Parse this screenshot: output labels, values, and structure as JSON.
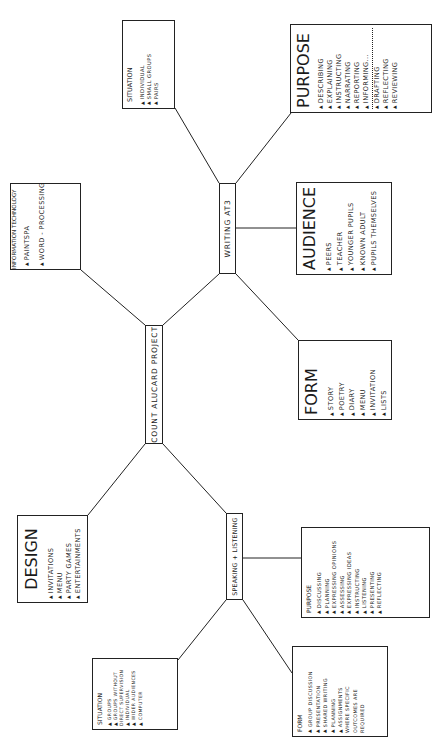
{
  "diagram": {
    "center": {
      "label": "COUNT ALUCARD PROJECT"
    },
    "hubs": {
      "writing": {
        "label": "WRITING AT3"
      },
      "speaking": {
        "label": "SPEAKING + LISTENING"
      }
    },
    "nodes": {
      "it": {
        "title": "INFORMATION TECHNOLOGY",
        "items": [
          "PAINTSPA",
          "WORD - PROCESSING"
        ]
      },
      "design": {
        "title": "DESIGN",
        "items": [
          "INVITATIONS",
          "MENU",
          "PARTY GAMES",
          "ENTERTAINMENTS"
        ]
      },
      "writing_situation": {
        "title": "SITUATION",
        "items": [
          "INDIVIDUAL",
          "SMALL GROUPS",
          "PAIRS"
        ]
      },
      "writing_purpose": {
        "title": "PURPOSE",
        "items": [
          "DESCRIBING",
          "EXPLAINING",
          "INSTRUCTING",
          "NARRATING",
          "REPORTING",
          "INFORMING...",
          "DRAFTING",
          "REFLECTING",
          "REVIEWING"
        ]
      },
      "writing_audience": {
        "title": "AUDIENCE",
        "items": [
          "PEERS",
          "TEACHER",
          "YOUNGER PUPILS",
          "KNOWN ADULT",
          "PUPILS THEMSELVES"
        ]
      },
      "writing_form": {
        "title": "FORM",
        "items": [
          "STORY",
          "POETRY",
          "DIARY",
          "MENU",
          "INVITATION",
          "LISTS"
        ]
      },
      "speaking_purpose": {
        "title": "PURPOSE",
        "items": [
          "DISCUSSING",
          "PLANNING",
          "EXPRESSING OPINIONS",
          "ASSESSING",
          "EXPRESSING IDEAS",
          "INSTRUCTING",
          "LISTENING",
          "PRESENTING",
          "REFLECTING"
        ]
      },
      "speaking_situation": {
        "title": "SITUATION",
        "items": [
          "GROUPS",
          "GROUPS WITHOUT DIRECT SUPERVISION",
          "INDIVIDUAL",
          "WIDER AUDIENCES",
          "COMPUTER"
        ]
      },
      "speaking_form": {
        "title": "FORM",
        "items": [
          "GROUP DISCUSSION",
          "PRESENTATION",
          "SHARED WRITING",
          "PLANNING",
          "ASSIGNMENTS WHERE SPECIFIC OUTCOMES ARE REQUIRED"
        ]
      }
    },
    "bullet_glyph": "▲"
  }
}
